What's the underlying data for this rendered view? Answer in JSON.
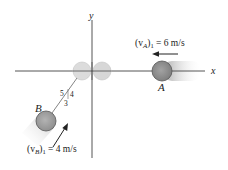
{
  "diagram": {
    "axes": {
      "x_label": "x",
      "y_label": "y"
    },
    "ball_a": {
      "label": "A",
      "velocity_label_prefix": "(v",
      "velocity_label_sub": "A",
      "velocity_label_suffix": ")",
      "velocity_label_index": "1",
      "velocity_label_value": " = 6 m/s",
      "velocity_text": "(vA)1 = 6 m/s",
      "color": "#8f8f8f"
    },
    "ball_b": {
      "label": "B",
      "velocity_label_prefix": "(v",
      "velocity_label_sub": "B",
      "velocity_label_suffix": ")",
      "velocity_label_index": "1",
      "velocity_label_value": " = 4 m/s",
      "velocity_text": "(vB)1 = 4 m/s",
      "color": "#a0a0a0"
    },
    "slope_triangle": {
      "hypotenuse": "5",
      "rise": "4",
      "run": "3"
    },
    "ghost_color": "#d6d6d6"
  }
}
